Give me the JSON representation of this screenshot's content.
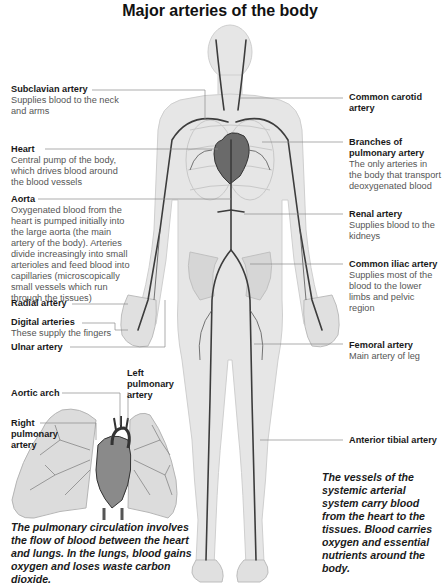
{
  "title": "Major arteries of the body",
  "labels_left": [
    {
      "heading": "Subclavian artery",
      "desc": "Supplies blood to the neck and arms"
    },
    {
      "heading": "Heart",
      "desc": "Central pump of the body, which drives blood around the blood vessels"
    },
    {
      "heading": "Aorta",
      "desc": "Oxygenated blood from the heart is pumped initially into the large aorta (the main artery of the body). Arteries divide increasingly into small arterioles and feed blood into capillaries (microscopically small vessels which run through the tissues)"
    },
    {
      "heading": "Radial artery",
      "desc": ""
    },
    {
      "heading": "Digital arteries",
      "desc": "These supply the fingers"
    },
    {
      "heading": "Ulnar artery",
      "desc": ""
    }
  ],
  "labels_right": [
    {
      "heading": "Common carotid artery",
      "desc": ""
    },
    {
      "heading": "Branches of pulmonary artery",
      "desc": "The only arteries in the body that transport deoxygenated blood"
    },
    {
      "heading": "Renal artery",
      "desc": "Supplies blood to the kidneys"
    },
    {
      "heading": "Common iliac artery",
      "desc": "Supplies most of the blood to the lower limbs and pelvic region"
    },
    {
      "heading": "Femoral artery",
      "desc": "Main artery of leg"
    },
    {
      "heading": "Anterior tibial artery",
      "desc": ""
    }
  ],
  "inset": {
    "aortic_arch": "Aortic arch",
    "left_pulmonary_artery": "Left pulmonary artery",
    "right_pulmonary_artery": "Right pulmonary artery"
  },
  "captions": {
    "pulmonary": "The pulmonary circulation involves the flow of blood between the heart and lungs. In the lungs, blood gains oxygen and loses waste carbon dioxide.",
    "systemic": "The vessels of the systemic arterial system carry blood from the heart to the tissues. Blood carries oxygen and essential nutrients around the body."
  },
  "colors": {
    "body": "#e4e4e4",
    "artery": "#3c3c3c",
    "leader": "#8a8a8a",
    "lung": "#d8d8d8"
  }
}
